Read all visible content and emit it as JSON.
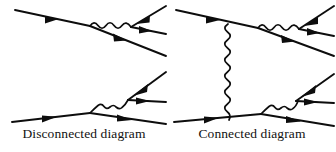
{
  "figure": {
    "background_color": "#ffffff",
    "line_color": "#0d0d0d",
    "width": 336,
    "height": 152
  },
  "panels": [
    {
      "id": "disconnected",
      "caption": "Disconnected diagram",
      "description": "Two independent sub-diagrams, each a single-photon-exchange-free vertex pair with no line joining the upper and lower halves",
      "subdiagrams": [
        {
          "id": "upper-left-subdiagram",
          "fermion_lines": [
            {
              "name": "incoming-fermion-upper-left",
              "from": [
                15,
                10
              ],
              "to": [
                90,
                26
              ],
              "arrow_direction": "right"
            },
            {
              "name": "outgoing-fermion-lower-right",
              "from": [
                90,
                26
              ],
              "to": [
                166,
                56
              ],
              "arrow_direction": "right"
            },
            {
              "name": "incoming-fermion-upper-right",
              "from": [
                166,
                6
              ],
              "to": [
                131,
                27
              ],
              "arrow_direction": "left"
            },
            {
              "name": "outgoing-fermion-middle-right",
              "from": [
                131,
                27
              ],
              "to": [
                166,
                34
              ],
              "arrow_direction": "right"
            }
          ],
          "photon_lines": [
            {
              "name": "photon-horizontal-upper",
              "from": [
                90,
                26
              ],
              "to": [
                131,
                27
              ],
              "wiggles": 5
            }
          ]
        },
        {
          "id": "lower-left-subdiagram",
          "fermion_lines": [
            {
              "name": "incoming-fermion-lower-left",
              "from": [
                12,
                122
              ],
              "to": [
                90,
                113
              ],
              "arrow_direction": "right"
            },
            {
              "name": "outgoing-fermion-lower-right",
              "from": [
                90,
                113
              ],
              "to": [
                166,
                124
              ],
              "arrow_direction": "right"
            },
            {
              "name": "incoming-fermion-upper-right",
              "from": [
                166,
                72
              ],
              "to": [
                128,
                100
              ],
              "arrow_direction": "left"
            },
            {
              "name": "outgoing-fermion-middle-right",
              "from": [
                128,
                100
              ],
              "to": [
                166,
                102
              ],
              "arrow_direction": "right"
            }
          ],
          "photon_lines": [
            {
              "name": "photon-rising-lower",
              "from": [
                90,
                113
              ],
              "to": [
                128,
                100
              ],
              "wiggles": 5
            }
          ]
        }
      ]
    },
    {
      "id": "connected",
      "caption": "Connected diagram",
      "description": "Same two vertex pairs, now joined by a vertical exchanged photon linking the upper and lower fermion lines",
      "subdiagrams": [
        {
          "id": "upper-right-subdiagram",
          "fermion_lines": [
            {
              "name": "incoming-fermion-upper-left",
              "from": [
                8,
                10
              ],
              "to": [
                90,
                28
              ],
              "arrow_direction": "right"
            },
            {
              "name": "outgoing-fermion-lower-right",
              "from": [
                90,
                28
              ],
              "to": [
                166,
                56
              ],
              "arrow_direction": "right"
            },
            {
              "name": "incoming-fermion-upper-right",
              "from": [
                166,
                6
              ],
              "to": [
                131,
                29
              ],
              "arrow_direction": "left"
            },
            {
              "name": "outgoing-fermion-middle-right",
              "from": [
                131,
                29
              ],
              "to": [
                166,
                36
              ],
              "arrow_direction": "right"
            }
          ],
          "photon_lines": [
            {
              "name": "photon-horizontal-upper",
              "from": [
                90,
                28
              ],
              "to": [
                131,
                29
              ],
              "wiggles": 5
            }
          ]
        },
        {
          "id": "lower-right-subdiagram",
          "fermion_lines": [
            {
              "name": "incoming-fermion-lower-left",
              "from": [
                6,
                122
              ],
              "to": [
                93,
                114
              ],
              "arrow_direction": "right"
            },
            {
              "name": "outgoing-fermion-lower-right",
              "from": [
                93,
                114
              ],
              "to": [
                166,
                126
              ],
              "arrow_direction": "right"
            },
            {
              "name": "incoming-fermion-upper-right",
              "from": [
                166,
                74
              ],
              "to": [
                128,
                101
              ],
              "arrow_direction": "left"
            },
            {
              "name": "outgoing-fermion-middle-right",
              "from": [
                128,
                101
              ],
              "to": [
                166,
                103
              ],
              "arrow_direction": "right"
            }
          ],
          "photon_lines": [
            {
              "name": "photon-rising-lower",
              "from": [
                93,
                114
              ],
              "to": [
                128,
                101
              ],
              "wiggles": 5
            }
          ]
        },
        {
          "id": "exchange",
          "photon_lines": [
            {
              "name": "photon-vertical-exchange",
              "from": [
                60,
                24
              ],
              "to": [
                61,
                120
              ],
              "wiggles": 13
            }
          ]
        }
      ]
    }
  ]
}
